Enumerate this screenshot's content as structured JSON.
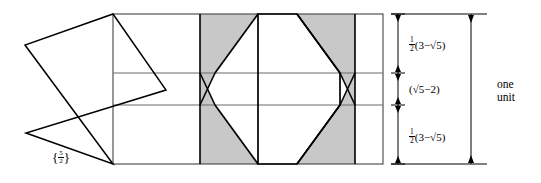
{
  "figure": {
    "type": "geometric-diagram",
    "colors": {
      "stroke": "#000000",
      "thin_stroke": "#555555",
      "shade_fill": "#c8c8c8",
      "background": "#ffffff"
    },
    "canvas": {
      "width": 541,
      "height": 183
    }
  },
  "labels": {
    "schlafli_symbol": {
      "open": "{",
      "numerator": "5",
      "denominator": "2",
      "close": "}"
    },
    "band_top": {
      "coefficient_num": "1",
      "coefficient_den": "2",
      "expression": "(3−√5)"
    },
    "band_middle": {
      "expression": "(√5−2)"
    },
    "band_bottom": {
      "coefficient_num": "1",
      "coefficient_den": "2",
      "expression": "(3−√5)"
    },
    "unit_measure": {
      "line1": "one",
      "line2": "unit"
    }
  },
  "geometry": {
    "rectangle": {
      "left": 113,
      "top": 14,
      "right": 383,
      "bottom": 164
    },
    "horizontal_band_lines": [
      73,
      105
    ],
    "shaded_region": {
      "left": 200,
      "right": 355
    },
    "pentagram_points": [
      [
        113,
        14
      ],
      [
        25,
        45
      ],
      [
        166,
        90
      ],
      [
        26,
        133
      ],
      [
        113,
        164
      ]
    ],
    "dimension_arrows": {
      "x_inner": 398,
      "x_outer": 471,
      "tick_levels": [
        14,
        73,
        105,
        164
      ]
    }
  }
}
